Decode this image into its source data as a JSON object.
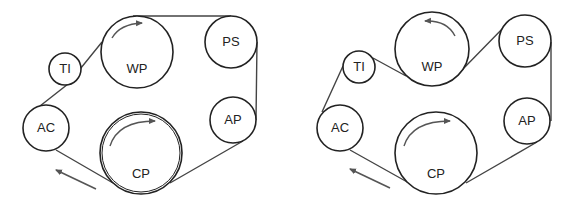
{
  "diagrams": [
    {
      "name": "left-belt-routing",
      "pulleys": [
        {
          "id": "TI",
          "label": "TI",
          "cx": 65,
          "cy": 69,
          "r": 16
        },
        {
          "id": "WP",
          "label": "WP",
          "cx": 137,
          "cy": 52,
          "r": 36,
          "rotation": "clockwise"
        },
        {
          "id": "PS",
          "label": "PS",
          "cx": 231,
          "cy": 42,
          "r": 26
        },
        {
          "id": "AC",
          "label": "AC",
          "cx": 46,
          "cy": 128,
          "r": 23
        },
        {
          "id": "CP",
          "label": "CP",
          "cx": 141,
          "cy": 153,
          "r": 41,
          "rotation": "clockwise"
        },
        {
          "id": "AP",
          "label": "AP",
          "cx": 233,
          "cy": 120,
          "r": 23
        }
      ],
      "belt_direction": "up-left"
    },
    {
      "name": "right-belt-routing",
      "pulleys": [
        {
          "id": "TI",
          "label": "TI",
          "cx": 359,
          "cy": 67,
          "r": 16
        },
        {
          "id": "WP",
          "label": "WP",
          "cx": 432,
          "cy": 49,
          "r": 37,
          "rotation": "counterclockwise"
        },
        {
          "id": "PS",
          "label": "PS",
          "cx": 525,
          "cy": 41,
          "r": 26
        },
        {
          "id": "AC",
          "label": "AC",
          "cx": 340,
          "cy": 128,
          "r": 23
        },
        {
          "id": "CP",
          "label": "CP",
          "cx": 436,
          "cy": 153,
          "r": 41,
          "rotation": "clockwise"
        },
        {
          "id": "AP",
          "label": "AP",
          "cx": 527,
          "cy": 121,
          "r": 23
        }
      ],
      "belt_direction": "up-left"
    }
  ],
  "labels": {
    "left": {
      "TI": "TI",
      "WP": "WP",
      "PS": "PS",
      "AC": "AC",
      "CP": "CP",
      "AP": "AP"
    },
    "right": {
      "TI": "TI",
      "WP": "WP",
      "PS": "PS",
      "AC": "AC",
      "CP": "CP",
      "AP": "AP"
    }
  },
  "colors": {
    "line": "#222222",
    "belt": "#444444",
    "arrow": "#555555",
    "background": "#ffffff"
  }
}
